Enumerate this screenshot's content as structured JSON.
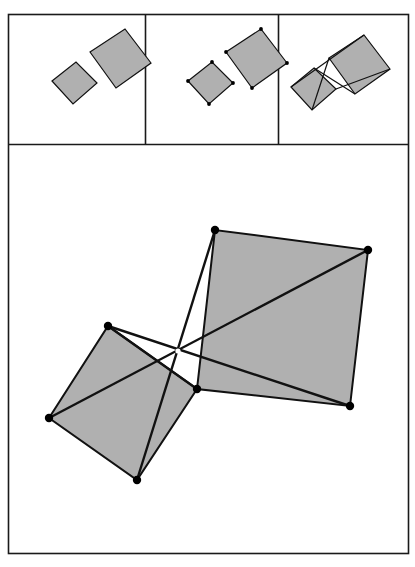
{
  "figure": {
    "background_color": "#ffffff",
    "stroke_color": "#111111",
    "frame_color": "#1a1a1a",
    "square_fill_color": "#b0b0b0",
    "vertex_dot_color": "#000000",
    "panel_count": 4
  },
  "outer_frame": {
    "name": "outer-border",
    "x": 8,
    "y": 14,
    "width": 400,
    "height": 539,
    "stroke_width": 1.6
  },
  "top_row": {
    "name": "three-step-construction-strip",
    "y": 14,
    "height": 130,
    "dividers_x": [
      145,
      278
    ],
    "panels": [
      {
        "index": 1,
        "label": "step-1-two-squares-plain",
        "x": 8,
        "width": 137,
        "shows_vertex_dots": false,
        "shows_connectors": false,
        "small_square": [
          [
            52,
            81
          ],
          [
            76,
            62
          ],
          [
            97,
            83
          ],
          [
            73,
            104
          ]
        ],
        "large_square": [
          [
            90,
            52
          ],
          [
            125,
            29
          ],
          [
            151,
            63
          ],
          [
            116,
            88
          ]
        ]
      },
      {
        "index": 2,
        "label": "step-2-vertices-marked",
        "x": 145,
        "width": 133,
        "shows_vertex_dots": true,
        "shows_connectors": false,
        "small_square": [
          [
            188,
            81
          ],
          [
            212,
            62
          ],
          [
            233,
            83
          ],
          [
            209,
            104
          ]
        ],
        "large_square": [
          [
            226,
            52
          ],
          [
            261,
            29
          ],
          [
            287,
            63
          ],
          [
            252,
            88
          ]
        ]
      },
      {
        "index": 3,
        "label": "step-3-connectors-drawn",
        "x": 278,
        "width": 130,
        "shows_vertex_dots": false,
        "shows_connectors": true,
        "small_square": [
          [
            291,
            87
          ],
          [
            314,
            68
          ],
          [
            336,
            89
          ],
          [
            312,
            110
          ]
        ],
        "large_square": [
          [
            329,
            58
          ],
          [
            364,
            35
          ],
          [
            390,
            69
          ],
          [
            355,
            94
          ]
        ],
        "connectors": [
          [
            [
              314,
              68
            ],
            [
              355,
              94
            ]
          ],
          [
            [
              291,
              87
            ],
            [
              364,
              35
            ]
          ],
          [
            [
              329,
              58
            ],
            [
              312,
              110
            ]
          ],
          [
            [
              336,
              89
            ],
            [
              390,
              69
            ]
          ]
        ]
      }
    ]
  },
  "main_panel": {
    "name": "large-detail-panel",
    "x": 8,
    "y": 146,
    "width": 400,
    "height": 407,
    "shared_vertex": {
      "label": "common-vertex",
      "x": 197,
      "y": 389
    },
    "crossing_point": {
      "label": "diagonals-crossing",
      "x": 178,
      "y": 351
    },
    "small_square": {
      "label": "small-square",
      "points": [
        [
          49,
          418
        ],
        [
          108,
          326
        ],
        [
          197,
          389
        ],
        [
          137,
          480
        ]
      ]
    },
    "large_square": {
      "label": "large-square",
      "points": [
        [
          197,
          389
        ],
        [
          215,
          230
        ],
        [
          368,
          250
        ],
        [
          350,
          406
        ]
      ]
    },
    "connector_segments": [
      {
        "label": "connector-smalltop-to-bigbottomright",
        "from": [
          108,
          326
        ],
        "to": [
          350,
          406
        ]
      },
      {
        "label": "connector-smallleft-to-bigtopright",
        "from": [
          49,
          418
        ],
        "to": [
          368,
          250
        ]
      },
      {
        "label": "connector-bigtop-to-smallbottom",
        "from": [
          215,
          230
        ],
        "to": [
          137,
          480
        ]
      },
      {
        "label": "connector-smalltop-to-sharedvertex",
        "from": [
          108,
          326
        ],
        "to": [
          197,
          389
        ]
      }
    ],
    "vertex_dots": [
      {
        "label": "vertex-small-left",
        "x": 49,
        "y": 418
      },
      {
        "label": "vertex-small-top",
        "x": 108,
        "y": 326
      },
      {
        "label": "vertex-small-bottom",
        "x": 137,
        "y": 480
      },
      {
        "label": "vertex-shared",
        "x": 197,
        "y": 389
      },
      {
        "label": "vertex-large-top",
        "x": 215,
        "y": 230
      },
      {
        "label": "vertex-large-topright",
        "x": 368,
        "y": 250
      },
      {
        "label": "vertex-large-bottomright",
        "x": 350,
        "y": 406
      }
    ]
  },
  "stroke_widths": {
    "square_outline_small_panel": 1.2,
    "square_outline_main": 2.0,
    "connector_small_panel": 1.2,
    "connector_main": 2.4
  }
}
